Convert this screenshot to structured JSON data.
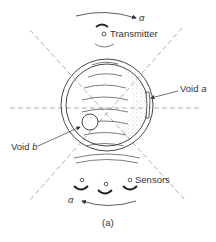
{
  "diagram": {
    "caption": "(a)",
    "labels": {
      "transmitter": "Transmitter",
      "void_a_prefix": "Void ",
      "void_a_var": "a",
      "void_b_prefix": "Void ",
      "void_b_var": "b",
      "sensors": "Sensors",
      "alpha_top": "α",
      "alpha_bottom": "α"
    },
    "colors": {
      "line": "#333333",
      "dashed": "#999999",
      "stipple": "#bbbbbb"
    }
  }
}
